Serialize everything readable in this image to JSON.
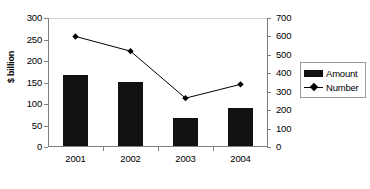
{
  "chart_data": {
    "type": "bar",
    "title": "",
    "subtitle": "",
    "xlabel": "",
    "ylabel": "$ billion",
    "ylabel_secondary": "",
    "categories": [
      "2001",
      "2002",
      "2003",
      "2004"
    ],
    "series": [
      {
        "name": "Amount",
        "type": "bar",
        "axis": "left",
        "unit": "$ billion",
        "color": "#111111",
        "values": [
          165,
          149,
          65,
          89
        ]
      },
      {
        "name": "Number",
        "type": "line",
        "axis": "right",
        "marker": "diamond",
        "color": "#000000",
        "values": [
          600,
          520,
          265,
          340
        ]
      }
    ],
    "ylim": [
      0,
      300
    ],
    "yticks": [
      0,
      50,
      100,
      150,
      200,
      250,
      300
    ],
    "ylim_secondary": [
      0,
      700
    ],
    "yticks_secondary": [
      0,
      100,
      200,
      300,
      400,
      500,
      600,
      700
    ],
    "grid": false,
    "legend_position": "right",
    "legend_entries": [
      "Amount",
      "Number"
    ]
  },
  "axes": {
    "left": {
      "label": "$ billion",
      "ticks": [
        "300",
        "250",
        "200",
        "150",
        "100",
        "50",
        "0"
      ]
    },
    "right": {
      "label": "",
      "ticks": [
        "700",
        "600",
        "500",
        "400",
        "300",
        "200",
        "100",
        "0"
      ]
    },
    "category": {
      "labels": [
        "2001",
        "2002",
        "2003",
        "2004"
      ]
    }
  },
  "legend": {
    "items": [
      {
        "label": "Amount",
        "swatch": "bar-swatch-icon"
      },
      {
        "label": "Number",
        "swatch": "line-marker-icon"
      }
    ]
  }
}
